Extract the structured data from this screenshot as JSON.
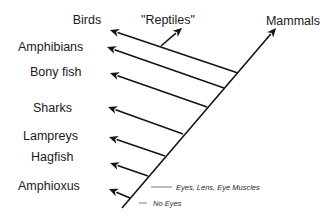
{
  "diagram": {
    "type": "cladogram",
    "trunk": {
      "label": "Mammals",
      "from": [
        122,
        208
      ],
      "to": [
        276,
        28
      ]
    },
    "taxa": [
      {
        "label": "Birds",
        "tip": [
          110,
          30
        ],
        "junction": [
          238,
          73
        ],
        "label_x": 87,
        "label_y": 24,
        "anchor": "middle"
      },
      {
        "label": "Amphibians",
        "tip": [
          107,
          47
        ],
        "junction": [
          224,
          88
        ],
        "label_x": 18,
        "label_y": 51,
        "anchor": "start"
      },
      {
        "label": "Bony fish",
        "tip": [
          110,
          73
        ],
        "junction": [
          207,
          107
        ],
        "label_x": 30,
        "label_y": 76,
        "anchor": "start"
      },
      {
        "label": "Sharks",
        "tip": [
          108,
          107
        ],
        "junction": [
          183,
          134
        ],
        "label_x": 33,
        "label_y": 112,
        "anchor": "start"
      },
      {
        "label": "Lampreys",
        "tip": [
          109,
          137
        ],
        "junction": [
          165,
          156
        ],
        "label_x": 23,
        "label_y": 140,
        "anchor": "start"
      },
      {
        "label": "Hagfish",
        "tip": [
          110,
          163
        ],
        "junction": [
          148,
          176
        ],
        "label_x": 31,
        "label_y": 161,
        "anchor": "start"
      },
      {
        "label": "Amphioxus",
        "tip": [
          109,
          189
        ],
        "junction": [
          130,
          198
        ],
        "label_x": 18,
        "label_y": 190,
        "anchor": "start"
      }
    ],
    "reptiles": {
      "label": "\"Reptiles\"",
      "from": [
        161,
        46
      ],
      "tip": [
        182,
        28
      ],
      "label_x": 168,
      "label_y": 24
    },
    "mammals_label": {
      "text": "Mammals",
      "x": 293,
      "y": 25
    },
    "annotations": [
      {
        "text": "Eyes, Lens, Eye Muscles",
        "line": [
          151,
          187,
          172,
          187
        ],
        "text_x": 176,
        "text_y": 190
      },
      {
        "text": "No Eyes",
        "line": [
          139,
          203,
          147,
          203
        ],
        "text_x": 153,
        "text_y": 206
      }
    ]
  }
}
